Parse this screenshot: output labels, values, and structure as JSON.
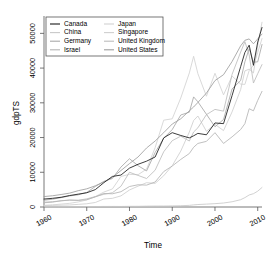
{
  "chart_data": {
    "type": "line",
    "title": "",
    "xlabel": "Time",
    "ylabel": "gdpTS",
    "xlim": [
      1960,
      2011
    ],
    "ylim": [
      0,
      55000
    ],
    "xticks": [
      1960,
      1970,
      1980,
      1990,
      2000,
      2010
    ],
    "yticks": [
      0,
      10000,
      20000,
      30000,
      40000,
      50000
    ],
    "grid": false,
    "legend_position": "top-left",
    "legend_columns": 2,
    "x": [
      1960,
      1962,
      1964,
      1966,
      1968,
      1970,
      1972,
      1974,
      1976,
      1978,
      1980,
      1982,
      1984,
      1986,
      1988,
      1990,
      1992,
      1994,
      1995,
      1996,
      1998,
      2000,
      2002,
      2004,
      2006,
      2007,
      2008,
      2009,
      2010,
      2011
    ],
    "series": [
      {
        "name": "Canada",
        "color": "#1a1a1a",
        "values": [
          2294,
          2500,
          2800,
          3300,
          3700,
          4100,
          5000,
          7000,
          8800,
          9200,
          11200,
          12300,
          13200,
          14400,
          19900,
          21400,
          20600,
          19900,
          20500,
          21200,
          20800,
          24200,
          24000,
          32100,
          40400,
          44500,
          46600,
          40800,
          47500,
          51700
        ]
      },
      {
        "name": "China",
        "color": "#c9c9c9",
        "values": [
          89,
          73,
          86,
          104,
          92,
          113,
          132,
          160,
          165,
          156,
          195,
          203,
          251,
          282,
          284,
          318,
          366,
          473,
          609,
          709,
          828,
          959,
          1148,
          1509,
          2099,
          2694,
          3468,
          3832,
          4560,
          5618
        ]
      },
      {
        "name": "Germany",
        "color": "#a8a8a8",
        "values": [
          1946,
          2250,
          2700,
          3200,
          3500,
          4200,
          5900,
          7400,
          8200,
          11500,
          13900,
          11900,
          10400,
          15700,
          19800,
          22300,
          26500,
          27300,
          31700,
          30300,
          26700,
          23100,
          25200,
          34000,
          36400,
          41800,
          45600,
          41700,
          41800,
          46800
        ]
      },
      {
        "name": "Israel",
        "color": "#b5b5b5",
        "values": [
          1229,
          1400,
          1800,
          2000,
          1900,
          2100,
          2900,
          3900,
          3800,
          4400,
          5900,
          6400,
          6300,
          7200,
          10200,
          11800,
          13700,
          15400,
          17200,
          18300,
          18900,
          21400,
          18300,
          20200,
          22300,
          24000,
          28300,
          27700,
          30700,
          33300
        ]
      },
      {
        "name": "Japan",
        "color": "#d2d2d2",
        "values": [
          479,
          610,
          840,
          1060,
          1450,
          2040,
          3000,
          4300,
          5200,
          8800,
          9400,
          9300,
          10900,
          17100,
          25000,
          25400,
          31400,
          38600,
          43400,
          38400,
          31900,
          38500,
          32300,
          37700,
          35400,
          35300,
          39300,
          40800,
          44500,
          48500
        ]
      },
      {
        "name": "Singapore",
        "color": "#cfcfcf",
        "values": [
          428,
          480,
          520,
          590,
          760,
          926,
          1300,
          2300,
          2500,
          3200,
          4900,
          6000,
          7000,
          6800,
          9000,
          11900,
          16100,
          21600,
          24900,
          26200,
          21800,
          23800,
          22000,
          27400,
          33800,
          39200,
          39700,
          38600,
          46500,
          53200
        ]
      },
      {
        "name": "United Kingdom",
        "color": "#bdbdbd",
        "values": [
          1380,
          1530,
          1780,
          1980,
          1930,
          2350,
          2990,
          3650,
          4100,
          5970,
          10000,
          9100,
          8200,
          10600,
          15900,
          19100,
          20400,
          19000,
          21600,
          22800,
          26600,
          28100,
          27600,
          38200,
          44600,
          47600,
          43800,
          35700,
          38400,
          41000
        ]
      },
      {
        "name": "United States",
        "color": "#9e9e9e",
        "values": [
          3007,
          3240,
          3600,
          4000,
          4700,
          5230,
          6100,
          7200,
          8500,
          10500,
          12500,
          14400,
          17000,
          19000,
          21400,
          23900,
          25400,
          27700,
          28800,
          30100,
          32800,
          36400,
          38100,
          41900,
          46400,
          48000,
          48400,
          47000,
          48400,
          49800
        ]
      }
    ]
  },
  "axes": {
    "x_tick_labels": [
      "1960",
      "1970",
      "1980",
      "1990",
      "2000",
      "2010"
    ],
    "y_tick_labels": [
      "0",
      "10000",
      "20000",
      "30000",
      "40000",
      "50000"
    ],
    "x_title": "Time",
    "y_title": "gdpTS"
  },
  "legend": {
    "column_left": [
      {
        "label": "Canada",
        "color": "#1a1a1a"
      },
      {
        "label": "China",
        "color": "#c9c9c9"
      },
      {
        "label": "Germany",
        "color": "#a8a8a8"
      },
      {
        "label": "Israel",
        "color": "#b5b5b5"
      }
    ],
    "column_right": [
      {
        "label": "Japan",
        "color": "#d2d2d2"
      },
      {
        "label": "Singapore",
        "color": "#cfcfcf"
      },
      {
        "label": "United Kingdom",
        "color": "#bdbdbd"
      },
      {
        "label": "United States",
        "color": "#9e9e9e"
      }
    ]
  }
}
